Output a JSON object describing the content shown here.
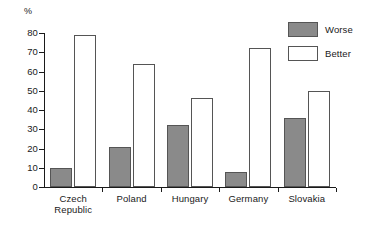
{
  "chart_data": {
    "type": "bar",
    "title": "",
    "xlabel": "",
    "ylabel": "%",
    "ylim": [
      0,
      80
    ],
    "ytick_step": 10,
    "yticks": [
      80,
      70,
      60,
      50,
      40,
      30,
      20,
      10,
      0
    ],
    "grid": false,
    "legend_position": "top-right",
    "categories": [
      "Czech Republic",
      "Poland",
      "Hungary",
      "Germany",
      "Slovakia"
    ],
    "category_lines": [
      [
        "Czech",
        "Republic"
      ],
      [
        "Poland"
      ],
      [
        "Hungary"
      ],
      [
        "Germany"
      ],
      [
        "Slovakia"
      ]
    ],
    "series": [
      {
        "name": "Worse",
        "color": "#8a8a8a",
        "values": [
          10,
          21,
          32,
          8,
          36
        ]
      },
      {
        "name": "Better",
        "color": "#ffffff",
        "values": [
          79,
          64,
          46,
          72,
          50
        ]
      }
    ]
  },
  "legend": {
    "items": [
      {
        "label": "Worse",
        "swatch": "worse"
      },
      {
        "label": "Better",
        "swatch": "better"
      }
    ]
  },
  "axis": {
    "unit": "%"
  },
  "colors": {
    "worse_fill": "#8a8a8a",
    "better_fill": "#ffffff",
    "bar_outline": "#555555",
    "axis": "#1a1a1a",
    "background": "#ffffff"
  }
}
